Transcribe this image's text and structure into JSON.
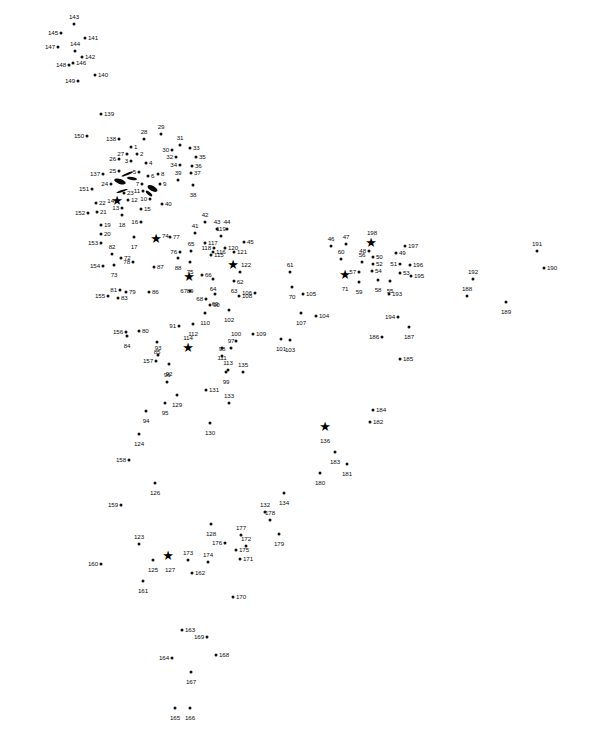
{
  "page": {
    "type": "connect-the-dots puzzle",
    "title": "",
    "background_color": "#ffffff",
    "dot_color": "#111111",
    "label_color": "#0d0d0d",
    "width": 601,
    "height": 731,
    "total_points": 198,
    "star_points": [
      14,
      74,
      89,
      114,
      122,
      127,
      136,
      198,
      71
    ]
  },
  "dots": [
    {
      "n": "1",
      "x": 131,
      "y": 147,
      "pos": "r"
    },
    {
      "n": "2",
      "x": 137,
      "y": 154,
      "pos": "r"
    },
    {
      "n": "3",
      "x": 131,
      "y": 161,
      "pos": "l"
    },
    {
      "n": "4",
      "x": 146,
      "y": 163,
      "pos": "r"
    },
    {
      "n": "5",
      "x": 139,
      "y": 172,
      "pos": "l"
    },
    {
      "n": "6",
      "x": 148,
      "y": 176,
      "pos": "r"
    },
    {
      "n": "7",
      "x": 142,
      "y": 184,
      "pos": "l"
    },
    {
      "n": "8",
      "x": 158,
      "y": 174,
      "pos": "r"
    },
    {
      "n": "9",
      "x": 160,
      "y": 184,
      "pos": "r"
    },
    {
      "n": "10",
      "x": 150,
      "y": 199,
      "pos": "l"
    },
    {
      "n": "11",
      "x": 143,
      "y": 191,
      "pos": "l"
    },
    {
      "n": "12",
      "x": 128,
      "y": 200,
      "pos": "r"
    },
    {
      "n": "13",
      "x": 122,
      "y": 208,
      "pos": "l"
    },
    {
      "n": "14",
      "x": 117,
      "y": 201,
      "pos": "l"
    },
    {
      "n": "15",
      "x": 141,
      "y": 209,
      "pos": "r"
    },
    {
      "n": "16",
      "x": 141,
      "y": 222,
      "pos": "l"
    },
    {
      "n": "17",
      "x": 134,
      "y": 237,
      "pos": "b"
    },
    {
      "n": "18",
      "x": 122,
      "y": 215,
      "pos": "b"
    },
    {
      "n": "19",
      "x": 101,
      "y": 225,
      "pos": "r"
    },
    {
      "n": "20",
      "x": 101,
      "y": 234,
      "pos": "r"
    },
    {
      "n": "21",
      "x": 97,
      "y": 212,
      "pos": "r"
    },
    {
      "n": "22",
      "x": 96,
      "y": 203,
      "pos": "r"
    },
    {
      "n": "23",
      "x": 124,
      "y": 193,
      "pos": "r"
    },
    {
      "n": "24",
      "x": 111,
      "y": 184,
      "pos": "l"
    },
    {
      "n": "25",
      "x": 119,
      "y": 171,
      "pos": "l"
    },
    {
      "n": "26",
      "x": 119,
      "y": 159,
      "pos": "l"
    },
    {
      "n": "27",
      "x": 127,
      "y": 154,
      "pos": "l"
    },
    {
      "n": "28",
      "x": 144,
      "y": 139,
      "pos": "t"
    },
    {
      "n": "29",
      "x": 161,
      "y": 134,
      "pos": "t"
    },
    {
      "n": "30",
      "x": 172,
      "y": 150,
      "pos": "l"
    },
    {
      "n": "31",
      "x": 180,
      "y": 145,
      "pos": "t"
    },
    {
      "n": "32",
      "x": 176,
      "y": 157,
      "pos": "l"
    },
    {
      "n": "33",
      "x": 190,
      "y": 148,
      "pos": "r"
    },
    {
      "n": "34",
      "x": 180,
      "y": 165,
      "pos": "l"
    },
    {
      "n": "35",
      "x": 196,
      "y": 157,
      "pos": "r"
    },
    {
      "n": "36",
      "x": 192,
      "y": 166,
      "pos": "r"
    },
    {
      "n": "37",
      "x": 191,
      "y": 173,
      "pos": "r"
    },
    {
      "n": "38",
      "x": 193,
      "y": 185,
      "pos": "b"
    },
    {
      "n": "39",
      "x": 178,
      "y": 180,
      "pos": "t"
    },
    {
      "n": "40",
      "x": 162,
      "y": 204,
      "pos": "r"
    },
    {
      "n": "41",
      "x": 195,
      "y": 233,
      "pos": "t"
    },
    {
      "n": "42",
      "x": 205,
      "y": 222,
      "pos": "t"
    },
    {
      "n": "43",
      "x": 217,
      "y": 229,
      "pos": "t"
    },
    {
      "n": "44",
      "x": 227,
      "y": 229,
      "pos": "t"
    },
    {
      "n": "45",
      "x": 244,
      "y": 242,
      "pos": "r"
    },
    {
      "n": "46",
      "x": 331,
      "y": 246,
      "pos": "t"
    },
    {
      "n": "47",
      "x": 346,
      "y": 244,
      "pos": "t"
    },
    {
      "n": "48",
      "x": 369,
      "y": 251,
      "pos": "l"
    },
    {
      "n": "49",
      "x": 396,
      "y": 253,
      "pos": "r"
    },
    {
      "n": "50",
      "x": 373,
      "y": 257,
      "pos": "r"
    },
    {
      "n": "51",
      "x": 400,
      "y": 264,
      "pos": "l"
    },
    {
      "n": "52",
      "x": 373,
      "y": 264,
      "pos": "r"
    },
    {
      "n": "53",
      "x": 400,
      "y": 273,
      "pos": "r"
    },
    {
      "n": "54",
      "x": 372,
      "y": 271,
      "pos": "r"
    },
    {
      "n": "55",
      "x": 390,
      "y": 281,
      "pos": "b"
    },
    {
      "n": "56",
      "x": 362,
      "y": 262,
      "pos": "t"
    },
    {
      "n": "57",
      "x": 359,
      "y": 272,
      "pos": "l"
    },
    {
      "n": "58",
      "x": 378,
      "y": 280,
      "pos": "b"
    },
    {
      "n": "59",
      "x": 359,
      "y": 282,
      "pos": "b"
    },
    {
      "n": "60",
      "x": 341,
      "y": 259,
      "pos": "t"
    },
    {
      "n": "61",
      "x": 290,
      "y": 272,
      "pos": "t"
    },
    {
      "n": "62",
      "x": 240,
      "y": 272,
      "pos": "b"
    },
    {
      "n": "63",
      "x": 234,
      "y": 281,
      "pos": "b"
    },
    {
      "n": "64",
      "x": 213,
      "y": 279,
      "pos": "b"
    },
    {
      "n": "65",
      "x": 191,
      "y": 251,
      "pos": "t"
    },
    {
      "n": "66",
      "x": 202,
      "y": 275,
      "pos": "r"
    },
    {
      "n": "67",
      "x": 190,
      "y": 291,
      "pos": "l"
    },
    {
      "n": "68",
      "x": 206,
      "y": 299,
      "pos": "l"
    },
    {
      "n": "69",
      "x": 215,
      "y": 294,
      "pos": "b"
    },
    {
      "n": "70",
      "x": 292,
      "y": 287,
      "pos": "b"
    },
    {
      "n": "71",
      "x": 345,
      "y": 279,
      "pos": "b"
    },
    {
      "n": "72",
      "x": 121,
      "y": 258,
      "pos": "r"
    },
    {
      "n": "73",
      "x": 114,
      "y": 265,
      "pos": "b"
    },
    {
      "n": "74",
      "x": 159,
      "y": 236,
      "pos": "r"
    },
    {
      "n": "75",
      "x": 190,
      "y": 262,
      "pos": "b"
    },
    {
      "n": "76",
      "x": 180,
      "y": 252,
      "pos": "l"
    },
    {
      "n": "77",
      "x": 170,
      "y": 237,
      "pos": "r"
    },
    {
      "n": "78",
      "x": 133,
      "y": 262,
      "pos": "l"
    },
    {
      "n": "79",
      "x": 126,
      "y": 292,
      "pos": "r"
    },
    {
      "n": "80",
      "x": 139,
      "y": 331,
      "pos": "r"
    },
    {
      "n": "81",
      "x": 120,
      "y": 290,
      "pos": "l"
    },
    {
      "n": "82",
      "x": 112,
      "y": 254,
      "pos": "t"
    },
    {
      "n": "83",
      "x": 118,
      "y": 298,
      "pos": "r"
    },
    {
      "n": "84",
      "x": 127,
      "y": 336,
      "pos": "b"
    },
    {
      "n": "85",
      "x": 157,
      "y": 342,
      "pos": "b"
    },
    {
      "n": "86",
      "x": 149,
      "y": 292,
      "pos": "r"
    },
    {
      "n": "87",
      "x": 154,
      "y": 267,
      "pos": "r"
    },
    {
      "n": "88",
      "x": 178,
      "y": 258,
      "pos": "b"
    },
    {
      "n": "89",
      "x": 190,
      "y": 281,
      "pos": "b"
    },
    {
      "n": "90",
      "x": 210,
      "y": 305,
      "pos": "r"
    },
    {
      "n": "91",
      "x": 179,
      "y": 326,
      "pos": "l"
    },
    {
      "n": "92",
      "x": 169,
      "y": 364,
      "pos": "b"
    },
    {
      "n": "93",
      "x": 158,
      "y": 355,
      "pos": "t"
    },
    {
      "n": "94",
      "x": 146,
      "y": 411,
      "pos": "b"
    },
    {
      "n": "95",
      "x": 165,
      "y": 403,
      "pos": "b"
    },
    {
      "n": "96",
      "x": 167,
      "y": 382,
      "pos": "t"
    },
    {
      "n": "97",
      "x": 231,
      "y": 348,
      "pos": "t"
    },
    {
      "n": "98",
      "x": 222,
      "y": 356,
      "pos": "t"
    },
    {
      "n": "99",
      "x": 226,
      "y": 372,
      "pos": "b"
    },
    {
      "n": "100",
      "x": 236,
      "y": 341,
      "pos": "t"
    },
    {
      "n": "101",
      "x": 281,
      "y": 339,
      "pos": "b"
    },
    {
      "n": "102",
      "x": 229,
      "y": 310,
      "pos": "b"
    },
    {
      "n": "103",
      "x": 290,
      "y": 340,
      "pos": "b"
    },
    {
      "n": "104",
      "x": 316,
      "y": 316,
      "pos": "r"
    },
    {
      "n": "105",
      "x": 303,
      "y": 294,
      "pos": "r"
    },
    {
      "n": "106",
      "x": 255,
      "y": 293,
      "pos": "l"
    },
    {
      "n": "107",
      "x": 301,
      "y": 313,
      "pos": "b"
    },
    {
      "n": "108",
      "x": 239,
      "y": 296,
      "pos": "r"
    },
    {
      "n": "109",
      "x": 253,
      "y": 334,
      "pos": "r"
    },
    {
      "n": "110",
      "x": 205,
      "y": 313,
      "pos": "b"
    },
    {
      "n": "111",
      "x": 222,
      "y": 348,
      "pos": "b"
    },
    {
      "n": "112",
      "x": 193,
      "y": 324,
      "pos": "b"
    },
    {
      "n": "113",
      "x": 228,
      "y": 370,
      "pos": "t"
    },
    {
      "n": "114",
      "x": 188,
      "y": 345,
      "pos": "t"
    },
    {
      "n": "115",
      "x": 211,
      "y": 255,
      "pos": "r"
    },
    {
      "n": "116",
      "x": 213,
      "y": 252,
      "pos": "r"
    },
    {
      "n": "117",
      "x": 205,
      "y": 243,
      "pos": "r"
    },
    {
      "n": "118",
      "x": 214,
      "y": 248,
      "pos": "l"
    },
    {
      "n": "119",
      "x": 221,
      "y": 236,
      "pos": "t"
    },
    {
      "n": "120",
      "x": 225,
      "y": 248,
      "pos": "r"
    },
    {
      "n": "121",
      "x": 234,
      "y": 252,
      "pos": "r"
    },
    {
      "n": "122",
      "x": 238,
      "y": 265,
      "pos": "r"
    },
    {
      "n": "123",
      "x": 139,
      "y": 544,
      "pos": "t"
    },
    {
      "n": "124",
      "x": 139,
      "y": 434,
      "pos": "b"
    },
    {
      "n": "125",
      "x": 153,
      "y": 560,
      "pos": "b"
    },
    {
      "n": "126",
      "x": 155,
      "y": 483,
      "pos": "b"
    },
    {
      "n": "127",
      "x": 170,
      "y": 560,
      "pos": "b"
    },
    {
      "n": "128",
      "x": 211,
      "y": 524,
      "pos": "b"
    },
    {
      "n": "129",
      "x": 177,
      "y": 395,
      "pos": "b"
    },
    {
      "n": "130",
      "x": 210,
      "y": 423,
      "pos": "b"
    },
    {
      "n": "131",
      "x": 206,
      "y": 390,
      "pos": "r"
    },
    {
      "n": "132",
      "x": 265,
      "y": 512,
      "pos": "t"
    },
    {
      "n": "133",
      "x": 229,
      "y": 403,
      "pos": "t"
    },
    {
      "n": "134",
      "x": 284,
      "y": 493,
      "pos": "b"
    },
    {
      "n": "135",
      "x": 243,
      "y": 372,
      "pos": "t"
    },
    {
      "n": "136",
      "x": 325,
      "y": 431,
      "pos": "b"
    },
    {
      "n": "137",
      "x": 103,
      "y": 174,
      "pos": "l"
    },
    {
      "n": "138",
      "x": 119,
      "y": 139,
      "pos": "l"
    },
    {
      "n": "139",
      "x": 101,
      "y": 114,
      "pos": "r"
    },
    {
      "n": "140",
      "x": 95,
      "y": 75,
      "pos": "r"
    },
    {
      "n": "141",
      "x": 85,
      "y": 38,
      "pos": "r"
    },
    {
      "n": "142",
      "x": 82,
      "y": 57,
      "pos": "r"
    },
    {
      "n": "143",
      "x": 74,
      "y": 24,
      "pos": "t"
    },
    {
      "n": "144",
      "x": 75,
      "y": 51,
      "pos": "t"
    },
    {
      "n": "145",
      "x": 61,
      "y": 33,
      "pos": "l"
    },
    {
      "n": "146",
      "x": 73,
      "y": 63,
      "pos": "r"
    },
    {
      "n": "147",
      "x": 58,
      "y": 47,
      "pos": "l"
    },
    {
      "n": "148",
      "x": 69,
      "y": 65,
      "pos": "l"
    },
    {
      "n": "149",
      "x": 78,
      "y": 81,
      "pos": "l"
    },
    {
      "n": "150",
      "x": 87,
      "y": 136,
      "pos": "l"
    },
    {
      "n": "151",
      "x": 92,
      "y": 189,
      "pos": "l"
    },
    {
      "n": "152",
      "x": 88,
      "y": 213,
      "pos": "l"
    },
    {
      "n": "153",
      "x": 101,
      "y": 243,
      "pos": "l"
    },
    {
      "n": "154",
      "x": 103,
      "y": 266,
      "pos": "l"
    },
    {
      "n": "155",
      "x": 108,
      "y": 296,
      "pos": "l"
    },
    {
      "n": "156",
      "x": 126,
      "y": 332,
      "pos": "l"
    },
    {
      "n": "157",
      "x": 156,
      "y": 361,
      "pos": "l"
    },
    {
      "n": "158",
      "x": 129,
      "y": 460,
      "pos": "l"
    },
    {
      "n": "159",
      "x": 121,
      "y": 505,
      "pos": "l"
    },
    {
      "n": "160",
      "x": 101,
      "y": 564,
      "pos": "l"
    },
    {
      "n": "161",
      "x": 143,
      "y": 581,
      "pos": "b"
    },
    {
      "n": "162",
      "x": 192,
      "y": 573,
      "pos": "r"
    },
    {
      "n": "163",
      "x": 182,
      "y": 630,
      "pos": "r"
    },
    {
      "n": "164",
      "x": 172,
      "y": 658,
      "pos": "l"
    },
    {
      "n": "165",
      "x": 175,
      "y": 708,
      "pos": "b"
    },
    {
      "n": "166",
      "x": 190,
      "y": 708,
      "pos": "b"
    },
    {
      "n": "167",
      "x": 191,
      "y": 672,
      "pos": "b"
    },
    {
      "n": "168",
      "x": 216,
      "y": 655,
      "pos": "r"
    },
    {
      "n": "169",
      "x": 207,
      "y": 637,
      "pos": "l"
    },
    {
      "n": "170",
      "x": 233,
      "y": 597,
      "pos": "r"
    },
    {
      "n": "171",
      "x": 240,
      "y": 559,
      "pos": "r"
    },
    {
      "n": "172",
      "x": 246,
      "y": 546,
      "pos": "t"
    },
    {
      "n": "173",
      "x": 188,
      "y": 560,
      "pos": "t"
    },
    {
      "n": "174",
      "x": 208,
      "y": 562,
      "pos": "t"
    },
    {
      "n": "175",
      "x": 236,
      "y": 550,
      "pos": "r"
    },
    {
      "n": "176",
      "x": 225,
      "y": 543,
      "pos": "l"
    },
    {
      "n": "177",
      "x": 241,
      "y": 535,
      "pos": "t"
    },
    {
      "n": "178",
      "x": 270,
      "y": 520,
      "pos": "t"
    },
    {
      "n": "179",
      "x": 279,
      "y": 534,
      "pos": "b"
    },
    {
      "n": "180",
      "x": 320,
      "y": 473,
      "pos": "b"
    },
    {
      "n": "181",
      "x": 347,
      "y": 464,
      "pos": "b"
    },
    {
      "n": "182",
      "x": 370,
      "y": 422,
      "pos": "r"
    },
    {
      "n": "183",
      "x": 335,
      "y": 452,
      "pos": "b"
    },
    {
      "n": "184",
      "x": 373,
      "y": 410,
      "pos": "r"
    },
    {
      "n": "185",
      "x": 400,
      "y": 359,
      "pos": "r"
    },
    {
      "n": "186",
      "x": 382,
      "y": 337,
      "pos": "l"
    },
    {
      "n": "187",
      "x": 409,
      "y": 327,
      "pos": "b"
    },
    {
      "n": "188",
      "x": 467,
      "y": 296,
      "pos": "t"
    },
    {
      "n": "189",
      "x": 506,
      "y": 302,
      "pos": "b"
    },
    {
      "n": "190",
      "x": 544,
      "y": 268,
      "pos": "r"
    },
    {
      "n": "191",
      "x": 537,
      "y": 251,
      "pos": "t"
    },
    {
      "n": "192",
      "x": 473,
      "y": 279,
      "pos": "t"
    },
    {
      "n": "193",
      "x": 389,
      "y": 294,
      "pos": "r"
    },
    {
      "n": "194",
      "x": 398,
      "y": 317,
      "pos": "l"
    },
    {
      "n": "195",
      "x": 411,
      "y": 276,
      "pos": "r"
    },
    {
      "n": "196",
      "x": 410,
      "y": 265,
      "pos": "r"
    },
    {
      "n": "197",
      "x": 405,
      "y": 246,
      "pos": "r"
    },
    {
      "n": "198",
      "x": 372,
      "y": 240,
      "pos": "t"
    }
  ],
  "stars": [
    {
      "n": "14",
      "x": 117,
      "y": 201
    },
    {
      "n": "74",
      "x": 156,
      "y": 239
    },
    {
      "n": "89",
      "x": 189,
      "y": 277
    },
    {
      "n": "114",
      "x": 188,
      "y": 348
    },
    {
      "n": "122",
      "x": 233,
      "y": 265
    },
    {
      "n": "127",
      "x": 168,
      "y": 556
    },
    {
      "n": "136",
      "x": 325,
      "y": 427
    },
    {
      "n": "198",
      "x": 371,
      "y": 243
    },
    {
      "n": "71",
      "x": 345,
      "y": 275
    }
  ],
  "strokes": [
    {
      "x": 121,
      "y": 173,
      "w": 13,
      "h": 2,
      "rot": -22
    },
    {
      "x": 127,
      "y": 177,
      "w": 10,
      "h": 3,
      "rot": 10
    },
    {
      "x": 114,
      "y": 179,
      "w": 12,
      "h": 5,
      "rot": 18
    },
    {
      "x": 116,
      "y": 190,
      "w": 12,
      "h": 2,
      "rot": -18
    },
    {
      "x": 147,
      "y": 186,
      "w": 11,
      "h": 5,
      "rot": 28
    },
    {
      "x": 145,
      "y": 192,
      "w": 8,
      "h": 3,
      "rot": 40
    }
  ]
}
